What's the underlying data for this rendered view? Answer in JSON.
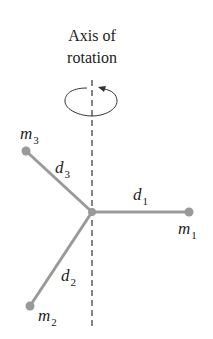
{
  "title": {
    "line1": "Axis of",
    "line2": "rotation"
  },
  "masses": [
    {
      "name": "m",
      "sub": "1"
    },
    {
      "name": "m",
      "sub": "2"
    },
    {
      "name": "m",
      "sub": "3"
    }
  ],
  "distances": [
    {
      "name": "d",
      "sub": "1"
    },
    {
      "name": "d",
      "sub": "2"
    },
    {
      "name": "d",
      "sub": "3"
    }
  ],
  "colors": {
    "rod": "#9a9a9a",
    "mass": "#999999",
    "axis": "#333333",
    "text": "#222222"
  }
}
